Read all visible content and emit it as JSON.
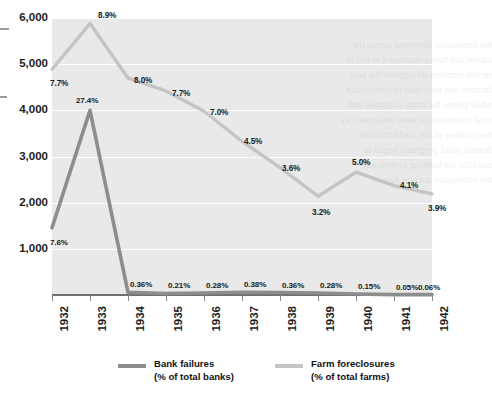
{
  "chart_data": {
    "type": "line",
    "title": "",
    "xlabel": "",
    "ylabel": "",
    "ylim": [
      0,
      6000
    ],
    "ytick_values": [
      1000,
      2000,
      3000,
      4000,
      5000,
      6000
    ],
    "ytick_labels": [
      "1,000",
      "2,000",
      "3,000",
      "4,000",
      "5,000",
      "6,000"
    ],
    "grid": "horizontal-white-gridlines",
    "legend_position": "bottom",
    "categories": [
      "1932",
      "1933",
      "1934",
      "1935",
      "1936",
      "1937",
      "1938",
      "1939",
      "1940",
      "1941",
      "1942"
    ],
    "series": [
      {
        "name": "Bank failures",
        "unit_label": "(% of total banks)",
        "color": "#8d8d8d",
        "values": [
          1456,
          4000,
          57,
          34,
          44,
          59,
          54,
          42,
          23,
          8,
          9
        ],
        "point_labels": [
          "7.6%",
          "27.4%",
          "0.36%",
          "0.21%",
          "0.28%",
          "0.38%",
          "0.36%",
          "0.28%",
          "0.15%",
          "0.05%",
          "0.06%"
        ]
      },
      {
        "name": "Farm foreclosures",
        "unit_label": "(% of total farms)",
        "color": "#c4c4c4",
        "values": [
          4890,
          5880,
          4700,
          4420,
          3980,
          3330,
          2760,
          2140,
          2660,
          2370,
          2190
        ],
        "point_labels": [
          "7.7%",
          "8.9%",
          "8.0%",
          "7.7%",
          "7.0%",
          "4.5%",
          "3.6%",
          "3.2%",
          "5.0%",
          "4.1%",
          "3.9%"
        ]
      }
    ]
  },
  "legend": {
    "bank": {
      "name": "Bank failures",
      "unit": "(% of total banks)",
      "swatch_color": "#8d8d8d"
    },
    "farm": {
      "name": "Farm foreclosures",
      "unit": "(% of total farms)",
      "swatch_color": "#c4c4c4"
    }
  },
  "ghost_text": {
    "lines": [
      "the depression deepened across the",
      "nation and banks continued to fail in",
      "record numbers throughout the year",
      "farmers lost their land to foreclosure",
      "while prices for crops collapsed and",
      "rural communities were devastated by",
      "the collapse of the credit markets",
      "federal relief programs began to",
      "stabilize the banking system after",
      "the emergency act was passed"
    ]
  }
}
